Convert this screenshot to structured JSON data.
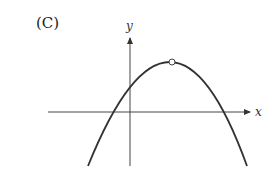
{
  "figure": {
    "choice_label": "(C)",
    "axes": {
      "x_label": "x",
      "y_label": "y"
    },
    "curve": {
      "type": "downward-opening parabola",
      "vertex_marker": "open-circle",
      "description": "Parabola opening downward with vertex in first quadrant; vertex marked by open circle; crosses negative x-axis and positive x-axis; positive y-intercept"
    },
    "colors": {
      "stroke": "#333333",
      "background": "#ffffff"
    }
  }
}
